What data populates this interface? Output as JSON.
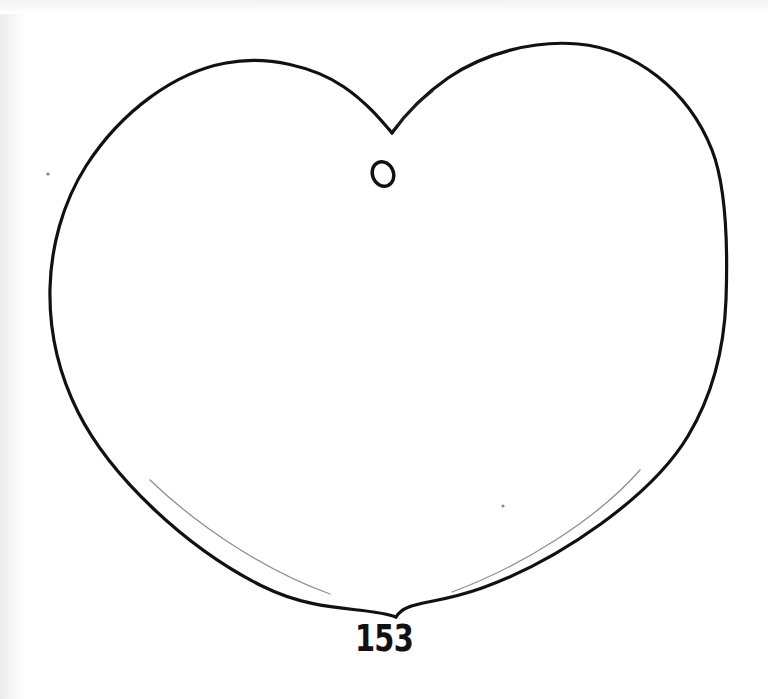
{
  "figure": {
    "caption_number": "153",
    "inner_mark_label": "o",
    "ink_color": "#111111",
    "background_color": "#ffffff",
    "shape_name": "heart-outline",
    "medium": "hand-drawn ink line on paper (scanned)",
    "caption_position": {
      "x": 394,
      "y": 638
    },
    "inner_mark_position": {
      "x": 383,
      "y": 174
    },
    "stroke_width_px": 3,
    "geometry": {
      "top_cleft": {
        "x": 392,
        "y": 133
      },
      "left_lobe_apex": {
        "x": 212,
        "y": 64
      },
      "right_lobe_apex": {
        "x": 578,
        "y": 44
      },
      "leftmost": {
        "x": 50,
        "y": 288
      },
      "rightmost": {
        "x": 726,
        "y": 300
      },
      "bottom_tip": {
        "x": 396,
        "y": 617
      }
    },
    "specks": [
      {
        "x": 48,
        "y": 174
      },
      {
        "x": 503,
        "y": 506
      }
    ]
  }
}
